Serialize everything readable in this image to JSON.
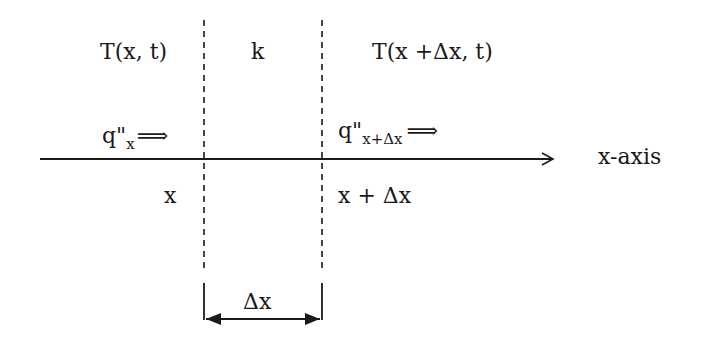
{
  "diagram": {
    "labels": {
      "temp_left": "T(x, t)",
      "conductivity": "k",
      "temp_right": "T(x +Δx, t)",
      "flux_left_base": "q\"",
      "flux_left_sub": "x",
      "flux_right_base": "q\"",
      "flux_right_sub": "x+Δx",
      "flux_arrow": "⟹",
      "axis_label": "x-axis",
      "pos_left": "x",
      "pos_right": "x + Δx",
      "width": "Δx"
    },
    "colors": {
      "ink": "#1a1a1a",
      "background": "#ffffff"
    }
  }
}
